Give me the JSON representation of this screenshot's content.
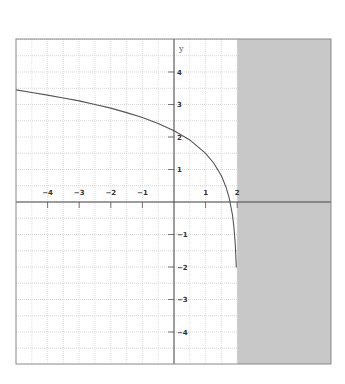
{
  "chart_data": {
    "type": "line",
    "title": "",
    "xlabel": "",
    "ylabel": "y",
    "xlim": [
      -5,
      5
    ],
    "ylim": [
      -5,
      5
    ],
    "grid": true,
    "x_ticks": [
      -4,
      -3,
      -2,
      -1,
      1,
      2
    ],
    "y_ticks": [
      4,
      3,
      2,
      1,
      -1,
      -2,
      -3,
      -4
    ],
    "x_tick_labels": [
      "−4",
      "−3",
      "−2",
      "−1",
      "1",
      "2"
    ],
    "y_tick_labels": [
      "4",
      "3",
      "2",
      "1",
      "−1",
      "−2",
      "−3",
      "−4"
    ],
    "shaded_region": {
      "x_from": 2,
      "x_to": 5,
      "color": "#c8c8c8",
      "meaning": "excluded domain x > 2"
    },
    "series": [
      {
        "name": "curve",
        "color": "#555555",
        "x": [
          -5.0,
          -4.5,
          -4.0,
          -3.5,
          -3.0,
          -2.5,
          -2.0,
          -1.5,
          -1.0,
          -0.5,
          0.0,
          0.5,
          1.0,
          1.25,
          1.5,
          1.65,
          1.75,
          1.85,
          1.9,
          1.94,
          1.97,
          1.985
        ],
        "y": [
          3.45,
          3.37,
          3.29,
          3.2,
          3.11,
          3.0,
          2.89,
          2.75,
          2.6,
          2.42,
          2.19,
          1.91,
          1.5,
          1.21,
          0.81,
          0.45,
          0.11,
          -0.4,
          -0.8,
          -1.31,
          -2.0,
          -2.0
        ]
      }
    ]
  },
  "axes": {
    "y_label": "y"
  }
}
